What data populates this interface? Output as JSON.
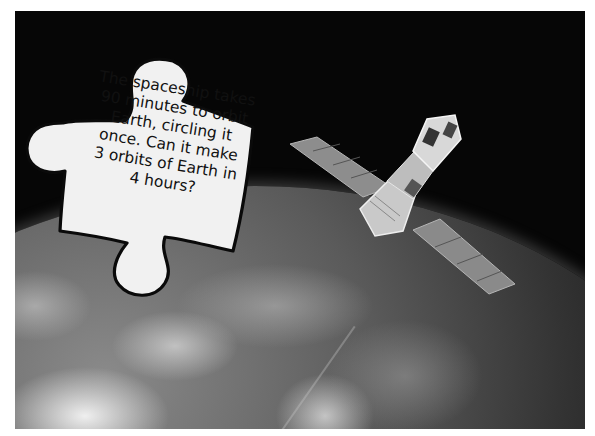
{
  "scene": {
    "description": "Satellite orbiting Earth viewed from space with a puzzle-piece shaped question card",
    "background_color": "#060606",
    "border_color": "#ffffff"
  },
  "puzzle_card": {
    "lines": [
      "The spaceship takes",
      "90 minutes to orbit",
      "Earth, circling it",
      "once. Can it make",
      "3 orbits of Earth in",
      "4 hours?"
    ]
  },
  "icons": [
    "satellite-icon",
    "earth-icon",
    "puzzle-piece-icon"
  ]
}
